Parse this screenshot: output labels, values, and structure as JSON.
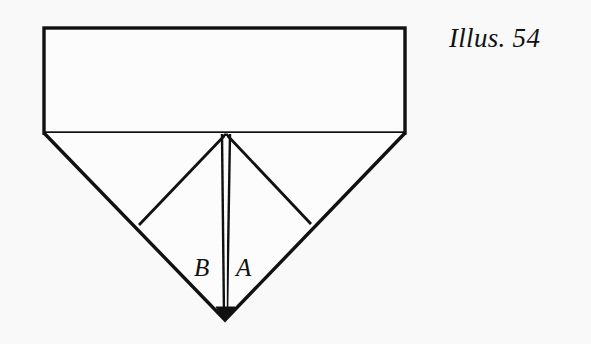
{
  "figure": {
    "caption": "Illus. 54",
    "background_color": "#f9f9fa",
    "ink_color": "#111111",
    "labels": {
      "left_flap": "B",
      "right_flap": "A"
    }
  },
  "diagram": {
    "type": "origami-fold-diagram",
    "geometry": {
      "rectangle": {
        "left": 44,
        "top": 28,
        "right": 405,
        "bottom": 133
      },
      "apex": {
        "x": 225,
        "y": 320
      },
      "center_top": {
        "x": 226,
        "y": 134
      },
      "inner_vertex_left": {
        "x": 139,
        "y": 225
      },
      "inner_vertex_right": {
        "x": 311,
        "y": 224
      },
      "vertical_crease": {
        "x_left_line": 221,
        "x_right_line": 230,
        "top_y": 134,
        "bottom_y": 318
      }
    },
    "stroke_widths": {
      "rectangle": 3.2,
      "outer_diagonal": 3.2,
      "inner_diagonal": 2.6,
      "crease": 2.2
    }
  }
}
